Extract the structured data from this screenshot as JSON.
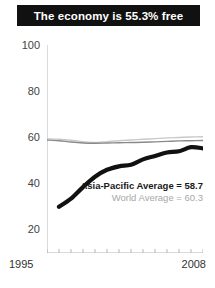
{
  "banner": {
    "title": "The economy is 55.3% free"
  },
  "annotations": {
    "regional": "Asia-Pacific Average = 58.7",
    "world": "World Average = 60.3"
  },
  "axis": {
    "x_start_label": "1995",
    "x_end_label": "2008",
    "y_labels": [
      "100",
      "80",
      "60",
      "40",
      "20"
    ]
  },
  "colors": {
    "banner_bg": "#111111",
    "banner_text": "#ffffff",
    "country_line": "#111111",
    "regional_line": "#8a8a8a",
    "world_line": "#c9c9c9",
    "axis": "#b5b5b5",
    "background": "#ffffff"
  },
  "chart_data": {
    "type": "line",
    "title": "The economy is 55.3% free",
    "xlabel": "",
    "ylabel": "",
    "xlim": [
      1995,
      2008
    ],
    "ylim": [
      10,
      100
    ],
    "grid": false,
    "legend": "annotation-right",
    "x": [
      1995,
      1996,
      1997,
      1998,
      1999,
      2000,
      2001,
      2002,
      2003,
      2004,
      2005,
      2006,
      2007,
      2008
    ],
    "y_ticks": [
      20,
      40,
      60,
      80,
      100
    ],
    "x_ticks": [
      1995,
      1996,
      1997,
      1998,
      1999,
      2000,
      2001,
      2002,
      2003,
      2004,
      2005,
      2006,
      2007,
      2008
    ],
    "series": [
      {
        "name": "Country",
        "style": "thick-black",
        "values": [
          null,
          30.0,
          33.5,
          38.5,
          43.0,
          46.0,
          47.5,
          48.2,
          50.5,
          52.0,
          53.5,
          54.0,
          55.8,
          55.3
        ]
      },
      {
        "name": "Asia-Pacific Average",
        "style": "thin-gray",
        "final_value": 58.7,
        "values": [
          58.9,
          58.6,
          58.0,
          57.6,
          57.5,
          57.6,
          57.7,
          57.8,
          57.9,
          58.1,
          58.3,
          58.5,
          58.6,
          58.7
        ]
      },
      {
        "name": "World Average",
        "style": "thin-light-gray",
        "final_value": 60.3,
        "values": [
          59.4,
          59.2,
          58.8,
          58.2,
          57.8,
          58.2,
          58.6,
          58.9,
          59.2,
          59.5,
          59.8,
          60.0,
          60.2,
          60.3
        ]
      }
    ]
  }
}
